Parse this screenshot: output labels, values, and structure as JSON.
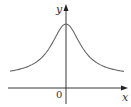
{
  "chart_data": {
    "type": "line",
    "title": "",
    "xlabel": "x",
    "ylabel": "y",
    "origin_label": "0",
    "x": [
      -4,
      -3,
      -2,
      -1.5,
      -1,
      -0.5,
      0,
      0.5,
      1,
      1.5,
      2,
      3,
      4
    ],
    "series": [
      {
        "name": "curve",
        "values": [
          0.06,
          0.1,
          0.2,
          0.31,
          0.5,
          0.8,
          1.0,
          0.8,
          0.5,
          0.31,
          0.2,
          0.1,
          0.06
        ]
      }
    ],
    "grid": false,
    "legend": "none"
  },
  "axes": {
    "x_label": "x",
    "y_label": "y",
    "origin": "0"
  },
  "colors": {
    "curve": "#666666",
    "axes": "#222222"
  }
}
